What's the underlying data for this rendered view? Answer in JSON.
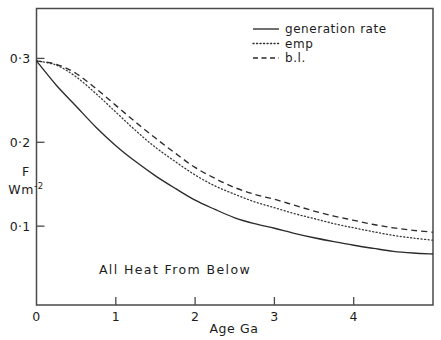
{
  "chart_data": {
    "type": "line",
    "title": "",
    "xlabel": "Age  Ga",
    "ylabel_line1": "F",
    "ylabel_line2": "Wm",
    "ylabel_exponent": "-2",
    "annotation": "All  Heat  From  Below",
    "xlim": [
      0,
      5.0
    ],
    "ylim": [
      0.006,
      0.3595
    ],
    "xticks": [
      0,
      1,
      2,
      3,
      4
    ],
    "xticklabels": [
      "0",
      "1",
      "2",
      "3",
      "4"
    ],
    "yticks": [
      0.1,
      0.2,
      0.3
    ],
    "yticklabels": [
      "0·1",
      "0·2",
      "0·3"
    ],
    "grid": false,
    "legend_position": "top-right",
    "x": [
      0,
      0.25,
      0.5,
      0.75,
      1.0,
      1.25,
      1.5,
      1.75,
      2.0,
      2.25,
      2.5,
      2.75,
      3.0,
      3.25,
      3.5,
      3.75,
      4.0,
      4.25,
      4.5,
      4.75,
      5.0
    ],
    "series": [
      {
        "name": "generation rate",
        "style": "solid",
        "color": "#2b2b2b",
        "values": [
          0.297,
          0.268,
          0.243,
          0.218,
          0.196,
          0.177,
          0.16,
          0.145,
          0.131,
          0.12,
          0.11,
          0.103,
          0.0975,
          0.0915,
          0.0862,
          0.0815,
          0.0772,
          0.0735,
          0.07,
          0.068,
          0.0668
        ]
      },
      {
        "name": "emp",
        "style": "dotted",
        "color": "#3a3a3a",
        "values": [
          0.297,
          0.292,
          0.278,
          0.258,
          0.236,
          0.214,
          0.194,
          0.177,
          0.161,
          0.148,
          0.138,
          0.129,
          0.122,
          0.115,
          0.109,
          0.103,
          0.098,
          0.0933,
          0.089,
          0.0858,
          0.0832
        ]
      },
      {
        "name": "b.l.",
        "style": "dashed",
        "color": "#2b2b2b",
        "values": [
          0.297,
          0.293,
          0.282,
          0.264,
          0.244,
          0.224,
          0.205,
          0.187,
          0.17,
          0.157,
          0.146,
          0.138,
          0.132,
          0.125,
          0.118,
          0.112,
          0.107,
          0.102,
          0.098,
          0.095,
          0.0928
        ]
      }
    ]
  },
  "legend": {
    "items": [
      {
        "label": "generation rate",
        "style": "solid"
      },
      {
        "label": "emp",
        "style": "dotted"
      },
      {
        "label": "b.l.",
        "style": "dashed"
      }
    ]
  },
  "colors": {
    "axis": "#4a4a4a",
    "text": "#1c1c1c",
    "background": "#ffffff"
  }
}
